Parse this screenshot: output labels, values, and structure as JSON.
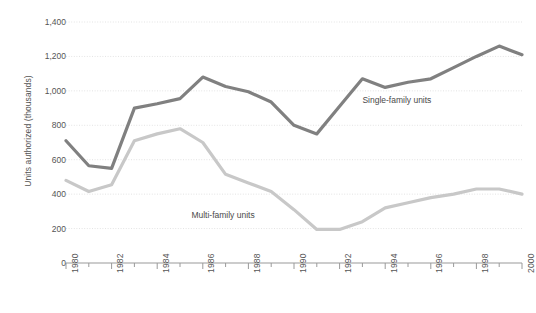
{
  "chart_data": {
    "type": "line",
    "title": "",
    "subtitle": "",
    "xlabel": "",
    "ylabel": "Units authorized (thousands)",
    "xlim": [
      1980,
      2000
    ],
    "ylim": [
      0,
      1400
    ],
    "grid": true,
    "legend_position": "inline-annotations",
    "y_ticks": [
      "0",
      "200",
      "400",
      "600",
      "800",
      "1,000",
      "1,200",
      "1,400"
    ],
    "y_tick_values": [
      0,
      200,
      400,
      600,
      800,
      1000,
      1200,
      1400
    ],
    "x_ticks": [
      "1980",
      "1982",
      "1984",
      "1986",
      "1988",
      "1990",
      "1992",
      "1994",
      "1996",
      "1998",
      "2000"
    ],
    "x_tick_values": [
      1980,
      1982,
      1984,
      1986,
      1988,
      1990,
      1992,
      1994,
      1996,
      1998,
      2000
    ],
    "x": [
      1980,
      1981,
      1982,
      1983,
      1984,
      1985,
      1986,
      1987,
      1988,
      1989,
      1990,
      1991,
      1992,
      1993,
      1994,
      1995,
      1996,
      1997,
      1998,
      1999,
      2000
    ],
    "series": [
      {
        "name": "Single-family units",
        "color": "#808080",
        "values": [
          710,
          565,
          550,
          900,
          925,
          955,
          1080,
          1025,
          995,
          935,
          800,
          750,
          910,
          1070,
          1020,
          1050,
          1070,
          1135,
          1200,
          1260,
          1210
        ]
      },
      {
        "name": "Multi-family units",
        "color": "#c8c8c8",
        "values": [
          480,
          415,
          455,
          710,
          750,
          780,
          700,
          515,
          465,
          415,
          310,
          195,
          195,
          240,
          320,
          350,
          380,
          400,
          430,
          430,
          400
        ]
      }
    ],
    "annotations": [
      {
        "text": "Single-family units",
        "x": 1993,
        "y": 940
      },
      {
        "text": "Multi-family units",
        "x": 1985.5,
        "y": 275
      }
    ]
  },
  "style": {
    "grid_color": "#e3e3e3",
    "axis_color": "#9a9a9a",
    "text_color": "#555555",
    "background": "#ffffff"
  }
}
